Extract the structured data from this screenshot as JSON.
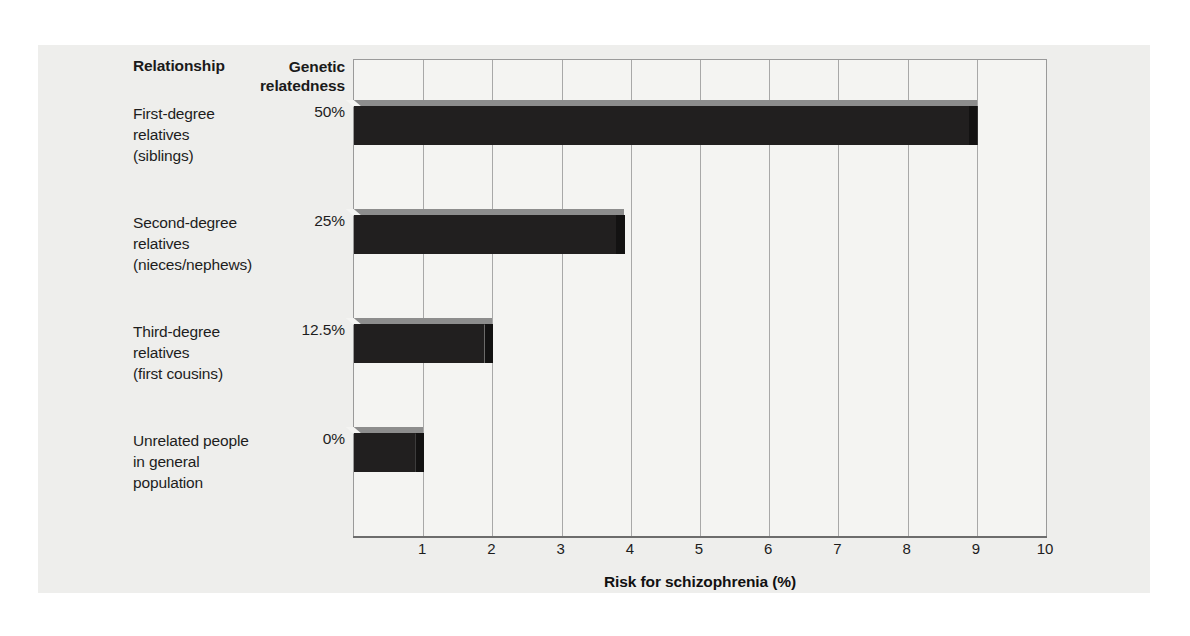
{
  "figure": {
    "header_relationship": "Relationship",
    "header_genetic": "Genetic relatedness"
  },
  "chart_data": {
    "type": "bar",
    "orientation": "horizontal",
    "title": "",
    "xlabel": "Risk for schizophrenia (%)",
    "ylabel": "",
    "xlim": [
      0,
      10
    ],
    "xticks": [
      "1",
      "2",
      "3",
      "4",
      "5",
      "6",
      "7",
      "8",
      "9",
      "10"
    ],
    "grid": true,
    "legend": "none",
    "bar_color": "#211f1f",
    "bar_top_color": "#8d8d8d",
    "categories": [
      "First-degree relatives (siblings)",
      "Second-degree relatives (nieces/nephews)",
      "Third-degree relatives (first cousins)",
      "Unrelated people in general population"
    ],
    "values": [
      9,
      3.9,
      2,
      1
    ],
    "genetic_relatedness": [
      "50%",
      "25%",
      "12.5%",
      "0%"
    ],
    "rows": [
      {
        "label_lines": [
          "First-degree",
          "relatives",
          "(siblings)"
        ],
        "genetic": "50%",
        "value": 9
      },
      {
        "label_lines": [
          "Second-degree",
          "relatives",
          "(nieces/nephews)"
        ],
        "genetic": "25%",
        "value": 3.9
      },
      {
        "label_lines": [
          "Third-degree",
          "relatives",
          "(first cousins)"
        ],
        "genetic": "12.5%",
        "value": 2
      },
      {
        "label_lines": [
          "Unrelated people",
          "in general",
          "population"
        ],
        "genetic": "0%",
        "value": 1
      }
    ]
  }
}
